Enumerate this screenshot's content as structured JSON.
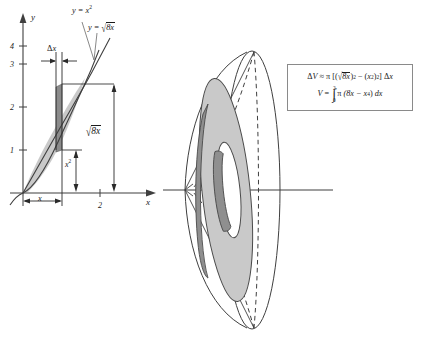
{
  "figure": {
    "background_color": "#ffffff",
    "line_color": "#3f3f3f",
    "fill_light": "#c9c9c9",
    "fill_dark": "#8f8f8f",
    "fill_white": "#ffffff"
  },
  "graph": {
    "name": "region-between-curves-graph",
    "axis_x_label": "x",
    "axis_y_label": "y",
    "y_ticks": [
      "1",
      "2",
      "3",
      "4"
    ],
    "x_ticks": [
      "2"
    ],
    "curve_upper_label": "y = √8x",
    "curve_lower_label": "y = x²",
    "curve_label_top_raw": "y = x",
    "curve_label_top_exp": "2",
    "curve_label_mid_prefix": "y = ",
    "curve_label_mid_radicand": "8x",
    "slice_label": "Δx",
    "slice_label_delta": "Δ",
    "slice_label_var": "x",
    "height_outer_label": "√8x",
    "height_outer_radicand": "8x",
    "height_inner_label": "x²",
    "height_inner_base": "x",
    "height_inner_exp": "2",
    "width_label": "x",
    "curves": [
      {
        "name": "y = x^2",
        "expression": "x^2"
      },
      {
        "name": "y = sqrt(8x)",
        "expression": "sqrt(8x)"
      }
    ],
    "intersection_point": [
      2,
      4
    ],
    "shaded_region": "between y = sqrt(8x) and y = x^2 from x = 0 to x = 2"
  },
  "solid": {
    "name": "solid-of-revolution",
    "description": "Lens-shaped solid generated by revolving the region about the x-axis, with a washer-shaped representative slice",
    "axis_of_revolution": "x-axis",
    "slice_shape": "washer (annulus)"
  },
  "formulas": {
    "name": "formula-box",
    "delta_v": {
      "lhs_delta": "Δ",
      "lhs_var": "V",
      "relation": "≈",
      "pi": "π",
      "open": "[(",
      "radicand": "8x",
      "outer_exp": "2",
      "minus": "−",
      "inner_open": "(",
      "inner_base": "x",
      "inner_exp": "2",
      "inner_close": ")",
      "inner_outer_exp": "2",
      "close": "]",
      "dx_delta": "Δ",
      "dx_var": "x",
      "plain": "ΔV ≈ π [(√8x)² − (x²)²] Δx"
    },
    "volume": {
      "lhs": "V",
      "equals": "=",
      "integral_sign": "∫",
      "lower_limit": "0",
      "upper_limit": "2",
      "pi": "π",
      "integrand_open": "(8x − x",
      "integrand_exp": "4",
      "integrand_close": ")",
      "differential": "dx",
      "plain": "V = ∫₀² π (8x − x⁴) dx"
    }
  }
}
